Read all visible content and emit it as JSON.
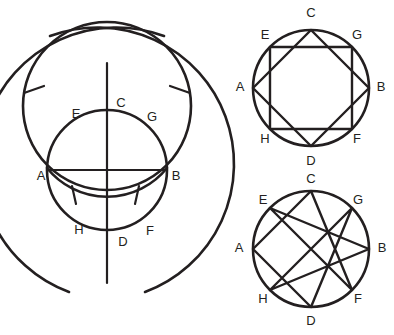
{
  "figure": {
    "ink_color": "#231f20",
    "background_color": "#ffffff",
    "panels": [
      {
        "id": "construction",
        "name": "compass-and-straightedge-construction",
        "description": "Overlapping circles and arcs with vertical axis, horizontal chord AB, and compass tick marks",
        "labels": [
          {
            "text": "A",
            "x": 41,
            "y": 177
          },
          {
            "text": "B",
            "x": 176,
            "y": 177
          },
          {
            "text": "C",
            "x": 121,
            "y": 104
          },
          {
            "text": "D",
            "x": 123,
            "y": 243
          },
          {
            "text": "E",
            "x": 76,
            "y": 115
          },
          {
            "text": "F",
            "x": 150,
            "y": 232
          },
          {
            "text": "G",
            "x": 152,
            "y": 118
          },
          {
            "text": "H",
            "x": 79,
            "y": 231
          }
        ]
      },
      {
        "id": "octagon",
        "name": "two-inscribed-squares-octagon",
        "description": "Circle with two overlapping inscribed squares ACBD and EGFH forming a regular octagon",
        "labels": [
          {
            "text": "C",
            "x": 311,
            "y": 14
          },
          {
            "text": "E",
            "x": 265,
            "y": 36
          },
          {
            "text": "G",
            "x": 357,
            "y": 36
          },
          {
            "text": "A",
            "x": 240,
            "y": 88
          },
          {
            "text": "B",
            "x": 381,
            "y": 88
          },
          {
            "text": "H",
            "x": 265,
            "y": 140
          },
          {
            "text": "F",
            "x": 357,
            "y": 140
          },
          {
            "text": "D",
            "x": 311,
            "y": 162
          }
        ]
      },
      {
        "id": "octagram",
        "name": "octagram-star-polygon",
        "description": "Circle with an 8/3 octagram star polygon connecting every third vertex",
        "labels": [
          {
            "text": "C",
            "x": 311,
            "y": 180
          },
          {
            "text": "E",
            "x": 263,
            "y": 201
          },
          {
            "text": "G",
            "x": 358,
            "y": 201
          },
          {
            "text": "A",
            "x": 239,
            "y": 249
          },
          {
            "text": "B",
            "x": 382,
            "y": 249
          },
          {
            "text": "H",
            "x": 263,
            "y": 300
          },
          {
            "text": "F",
            "x": 358,
            "y": 300
          },
          {
            "text": "D",
            "x": 311,
            "y": 322
          }
        ]
      }
    ],
    "vertex_order": [
      "C",
      "G",
      "B",
      "F",
      "D",
      "H",
      "A",
      "E"
    ],
    "star_skip": 3
  }
}
